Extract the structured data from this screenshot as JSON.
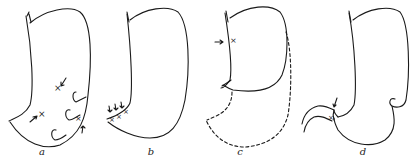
{
  "figure": {
    "panels": [
      {
        "id": "a",
        "label": "a",
        "description": "Stomach outline with multiple ulcer craters (x marks) indicated by arrows along lesser curvature"
      },
      {
        "id": "b",
        "label": "b",
        "description": "Stomach outline with a row of three x marks at the lesser curvature near the angle, each indicated by an arrow"
      },
      {
        "id": "c",
        "label": "c",
        "description": "Stomach outline showing upper portion retained, x mark with arrow high on lesser curvature, resected lower portion in dashed outline"
      },
      {
        "id": "d",
        "label": "d",
        "description": "Stomach outline with indentation on greater curvature, x mark at pylorus region indicated by arrow, duodenum curving to the left"
      }
    ],
    "colors": {
      "stroke": "#1a1a1a",
      "background": "#ffffff"
    }
  }
}
